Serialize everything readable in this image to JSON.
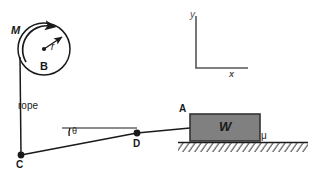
{
  "figure": {
    "background_color": "#ffffff",
    "stroke_color": "#1a1a1a",
    "block_fill_color": "#808080",
    "block_border_color": "#333333",
    "ground_hatch_color": "#555555",
    "width": 320,
    "height": 178
  },
  "drum": {
    "label_mass": "M",
    "label_body": "B",
    "label_radius": "r",
    "center_x": 44,
    "center_y": 49,
    "radius": 26,
    "rotation_direction": "counter-clockwise"
  },
  "rope": {
    "label": "rope",
    "segments": [
      {
        "name": "drum-to-C",
        "from": "drum-tangent",
        "to": "C",
        "orientation": "vertical"
      },
      {
        "name": "C-to-D",
        "from": "C",
        "to": "D",
        "orientation": "inclined"
      },
      {
        "name": "D-to-A",
        "from": "D",
        "to": "A",
        "orientation": "horizontal"
      }
    ]
  },
  "points": {
    "A": "A",
    "C": "C",
    "D": "D"
  },
  "angle": {
    "label": "θ",
    "vertex": "C",
    "between": "horizontal-reference-line and rope CD"
  },
  "block": {
    "label": "W",
    "x": 190,
    "y": 114,
    "width": 70,
    "height": 27
  },
  "friction": {
    "label": "μ",
    "location": "block-ground-interface"
  },
  "ground": {
    "surface_start_x": 178,
    "surface_end_x": 308,
    "surface_y": 142,
    "hatching": "diagonal"
  },
  "axes": {
    "y_label": "y",
    "x_label": "x",
    "origin_x": 196,
    "origin_y": 68,
    "y_top": 16,
    "x_right": 248
  }
}
